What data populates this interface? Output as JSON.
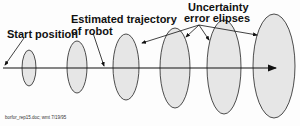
{
  "labels": {
    "start": "Start position",
    "trajectory_line1": "Estimated trajectory",
    "trajectory_line2": "of robot",
    "uncertainty_line1": "Uncertainty",
    "uncertainty_line2": "error elipses"
  },
  "caption": "borfor_rep15.doc; wmt 7/19/95",
  "colors": {
    "ellipse_fill": "#e6e6e6",
    "stroke": "#222222"
  },
  "ellipses": [
    {
      "cx": 29,
      "cy": 68,
      "rx": 7,
      "ry": 18
    },
    {
      "cx": 77,
      "cy": 67,
      "rx": 10,
      "ry": 26
    },
    {
      "cx": 126,
      "cy": 67,
      "rx": 13,
      "ry": 33
    },
    {
      "cx": 175,
      "cy": 68,
      "rx": 15,
      "ry": 40
    },
    {
      "cx": 224,
      "cy": 67,
      "rx": 17,
      "ry": 47
    },
    {
      "cx": 274,
      "cy": 66,
      "rx": 21,
      "ry": 52
    }
  ]
}
